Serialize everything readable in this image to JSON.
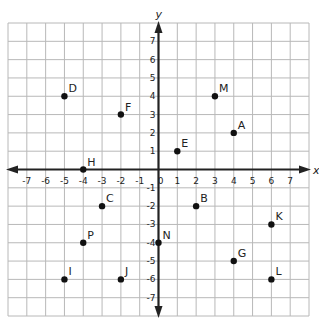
{
  "chart_data": {
    "type": "scatter",
    "title": "",
    "xlabel": "x",
    "ylabel": "y",
    "xlim": [
      -8,
      8
    ],
    "ylim": [
      -8,
      8
    ],
    "grid": true,
    "x_ticks": [
      -7,
      -6,
      -5,
      -4,
      -3,
      -2,
      -1,
      0,
      1,
      2,
      3,
      4,
      5,
      6,
      7
    ],
    "y_ticks": [
      -7,
      -6,
      -5,
      -4,
      -3,
      -2,
      -1,
      1,
      2,
      3,
      4,
      5,
      6,
      7
    ],
    "points": [
      {
        "label": "A",
        "x": 4,
        "y": 2
      },
      {
        "label": "B",
        "x": 2,
        "y": -2
      },
      {
        "label": "C",
        "x": -3,
        "y": -2
      },
      {
        "label": "D",
        "x": -5,
        "y": 4
      },
      {
        "label": "E",
        "x": 1,
        "y": 1
      },
      {
        "label": "F",
        "x": -2,
        "y": 3
      },
      {
        "label": "G",
        "x": 4,
        "y": -5
      },
      {
        "label": "H",
        "x": -4,
        "y": 0
      },
      {
        "label": "I",
        "x": -5,
        "y": -6
      },
      {
        "label": "J",
        "x": -2,
        "y": -6
      },
      {
        "label": "K",
        "x": 6,
        "y": -3
      },
      {
        "label": "L",
        "x": 6,
        "y": -6
      },
      {
        "label": "M",
        "x": 3,
        "y": 4
      },
      {
        "label": "N",
        "x": 0,
        "y": -4
      },
      {
        "label": "P",
        "x": -4,
        "y": -4
      }
    ]
  },
  "colors": {
    "grid": "#b8b8b8",
    "axis": "#222222",
    "point": "#111111"
  }
}
